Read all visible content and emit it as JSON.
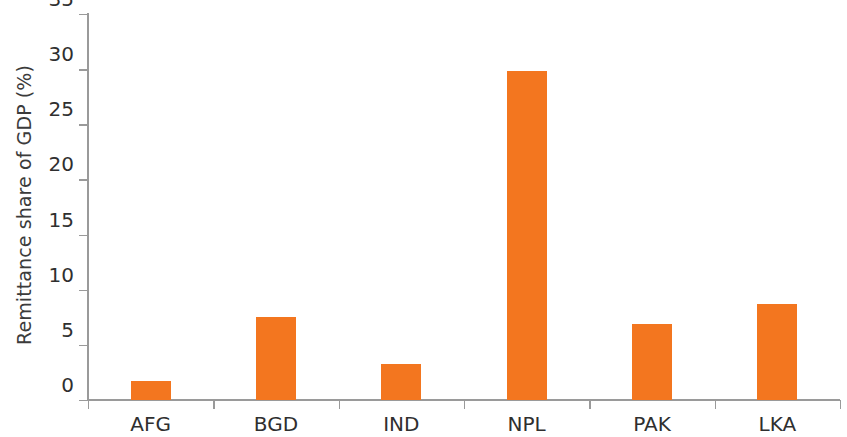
{
  "chart_data": {
    "type": "bar",
    "title": "",
    "subtitle": "",
    "xlabel": "",
    "ylabel": "Remittance share of GDP (%)",
    "categories": [
      "AFG",
      "BGD",
      "IND",
      "NPL",
      "PAK",
      "LKA"
    ],
    "values": [
      1.7,
      7.5,
      3.3,
      29.8,
      6.9,
      8.7
    ],
    "series": [
      {
        "name": "Remittance share of GDP",
        "values": [
          1.7,
          7.5,
          3.3,
          29.8,
          6.9,
          8.7
        ]
      }
    ],
    "ylim": [
      0,
      35
    ],
    "ytick_values": [
      0,
      5,
      10,
      15,
      20,
      25,
      30,
      35
    ],
    "ytick_labels": [
      "0",
      "5",
      "10",
      "15",
      "20",
      "25",
      "30",
      "35"
    ],
    "grid": false,
    "legend": null,
    "legend_position": "none",
    "bar_color": "#f3761f",
    "axis_color": "#9a9a9a",
    "text_color": "#2f2f2f",
    "background": "#ffffff",
    "annotations": []
  }
}
